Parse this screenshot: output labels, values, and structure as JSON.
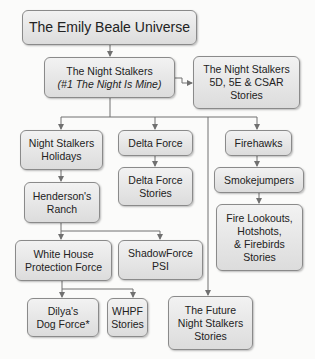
{
  "diagram": {
    "nodes": {
      "root": {
        "lines": [
          "The Emily Beale Universe"
        ]
      },
      "night_stalkers": {
        "lines": [
          "The Night Stalkers"
        ],
        "subtitle_prefix": "(#1 ",
        "subtitle_italic": "The Night Is Mine",
        "subtitle_suffix": ")"
      },
      "ns_5d": {
        "lines": [
          "The Night Stalkers",
          "5D, 5E & CSAR",
          "Stories"
        ]
      },
      "ns_holidays": {
        "lines": [
          "Night Stalkers",
          "Holidays"
        ]
      },
      "delta_force": {
        "lines": [
          "Delta Force"
        ]
      },
      "delta_force_stories": {
        "lines": [
          "Delta Force",
          "Stories"
        ]
      },
      "firehawks": {
        "lines": [
          "Firehawks"
        ]
      },
      "smokejumpers": {
        "lines": [
          "Smokejumpers"
        ]
      },
      "fire_lookouts": {
        "lines": [
          "Fire Lookouts,",
          "Hotshots,",
          "& Firebirds",
          "Stories"
        ]
      },
      "hendersons_ranch": {
        "lines": [
          "Henderson's",
          "Ranch"
        ]
      },
      "whpf": {
        "lines": [
          "White House",
          "Protection Force"
        ]
      },
      "shadowforce": {
        "lines": [
          "ShadowForce",
          "PSI"
        ]
      },
      "dilyas_dog_force": {
        "lines": [
          "Dilya's",
          "Dog Force*"
        ]
      },
      "whpf_stories": {
        "lines": [
          "WHPF",
          "Stories"
        ]
      },
      "future_ns": {
        "lines": [
          "The Future",
          "Night Stalkers",
          "Stories"
        ]
      }
    },
    "edges": [
      [
        "root",
        "night_stalkers"
      ],
      [
        "night_stalkers",
        "ns_5d"
      ],
      [
        "night_stalkers",
        "ns_holidays"
      ],
      [
        "night_stalkers",
        "delta_force"
      ],
      [
        "night_stalkers",
        "firehawks"
      ],
      [
        "night_stalkers",
        "future_ns"
      ],
      [
        "delta_force",
        "delta_force_stories"
      ],
      [
        "firehawks",
        "smokejumpers"
      ],
      [
        "smokejumpers",
        "fire_lookouts"
      ],
      [
        "ns_holidays",
        "hendersons_ranch"
      ],
      [
        "hendersons_ranch",
        "whpf"
      ],
      [
        "hendersons_ranch",
        "shadowforce"
      ],
      [
        "whpf",
        "dilyas_dog_force"
      ],
      [
        "whpf",
        "whpf_stories"
      ]
    ],
    "colors": {
      "node_fill": "#e6e6e6",
      "node_border": "#8a8a8a",
      "connector": "#707070"
    }
  }
}
